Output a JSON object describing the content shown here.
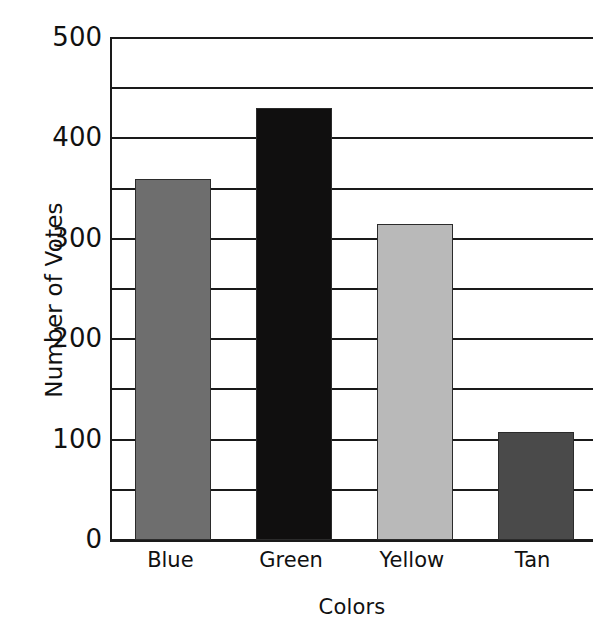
{
  "chart_data": {
    "type": "bar",
    "title": "",
    "xlabel": "Colors",
    "ylabel": "Number of Votes",
    "categories": [
      "Blue",
      "Green",
      "Yellow",
      "Tan"
    ],
    "values": [
      360,
      430,
      315,
      108
    ],
    "series": [
      {
        "name": "Number of Votes",
        "values": [
          360,
          430,
          315,
          108
        ]
      }
    ],
    "bar_colors": [
      "#6e6e6e",
      "#100f0f",
      "#b9b9b9",
      "#4a4a4a"
    ],
    "ylim": [
      0,
      500
    ],
    "major_ticks": [
      0,
      100,
      200,
      300,
      400,
      500
    ],
    "minor_tick_interval": 50,
    "gridlines": [
      0,
      50,
      100,
      150,
      200,
      250,
      300,
      350,
      400,
      450,
      500
    ],
    "grid": true,
    "legend": false,
    "legend_position": "none",
    "tick_labels_y": [
      "500",
      "400",
      "300",
      "200",
      "100",
      "0"
    ],
    "tick_labels_x": [
      "Blue",
      "Green",
      "Yellow",
      "Tan"
    ],
    "axis_color": "#1a1a1a",
    "background_color": "#ffffff"
  }
}
